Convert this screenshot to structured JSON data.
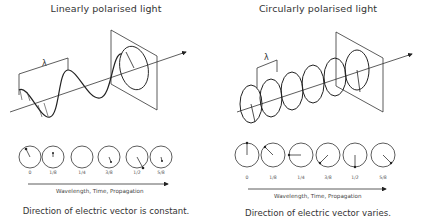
{
  "linear": {
    "title": "Linearly polarised light",
    "wavelength_symbol": "λ",
    "ticks": [
      "0",
      "1/8",
      "1/4",
      "3/8",
      "1/2",
      "5/8"
    ],
    "axis_label": "Wavelength, Time, Propagation",
    "caption": "Direction of electric vector is constant."
  },
  "circular": {
    "title": "Circularly polarised light",
    "wavelength_symbol": "λ",
    "ticks": [
      "0",
      "1/8",
      "1/4",
      "3/8",
      "1/2",
      "5/8"
    ],
    "axis_label": "Wavelength, Time, Propagation",
    "caption": "Direction of electric vector varies."
  },
  "colors": {
    "line": "#222222",
    "background": "#ffffff"
  }
}
